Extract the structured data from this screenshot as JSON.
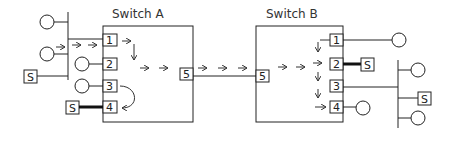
{
  "diagram": {
    "switches": [
      {
        "id": "A",
        "title": "Switch A",
        "ports": [
          "1",
          "2",
          "3",
          "4",
          "5"
        ]
      },
      {
        "id": "B",
        "title": "Switch B",
        "ports": [
          "1",
          "2",
          "3",
          "4",
          "5"
        ]
      }
    ],
    "server_label": "S",
    "links": [
      {
        "from": "Switch A port 5",
        "to": "Switch B port 5"
      },
      {
        "from": "Switch A port 4",
        "to": "Server",
        "thick": true
      },
      {
        "from": "Switch B port 2",
        "to": "Server",
        "thick": true
      }
    ],
    "colors": {
      "stroke": "#222222",
      "background": "#ffffff"
    }
  }
}
